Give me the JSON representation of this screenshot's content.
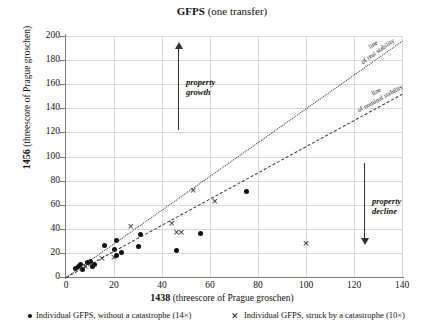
{
  "chart_data": {
    "type": "scatter",
    "title": "GFPS (one transfer)",
    "title_bold_part": "GFPS",
    "title_rest": " (one transfer)",
    "xlabel": "1438 (threescore of Prague groschen)",
    "xlabel_bold": "1438",
    "xlabel_rest": " (threescore of Prague groschen)",
    "ylabel": "1456 (threescore of Prague groschen)",
    "ylabel_bold": "1456",
    "ylabel_rest": " (threescore of Prague groschen)",
    "xlim": [
      0,
      140
    ],
    "ylim": [
      0,
      200
    ],
    "xticks": [
      0,
      20,
      40,
      60,
      80,
      100,
      120,
      140
    ],
    "yticks": [
      0,
      20,
      40,
      60,
      80,
      100,
      120,
      140,
      160,
      180,
      200
    ],
    "grid": true,
    "legend_position": "below-axis",
    "series": [
      {
        "name": "Individual GFPS, without a catastrophe (14×)",
        "marker": "dot",
        "count": 14,
        "points": [
          [
            4,
            7
          ],
          [
            5,
            9
          ],
          [
            6,
            10
          ],
          [
            7,
            6
          ],
          [
            9,
            12
          ],
          [
            10,
            13
          ],
          [
            11,
            9
          ],
          [
            12,
            10
          ],
          [
            16,
            26
          ],
          [
            20,
            23
          ],
          [
            21,
            30
          ],
          [
            23,
            20
          ],
          [
            30,
            25
          ],
          [
            31,
            35
          ]
        ]
      },
      {
        "name": "Individual GFPS, struck by a catastrophe (10×)",
        "marker": "cross",
        "count": 10,
        "points": [
          [
            8,
            9
          ],
          [
            15,
            15
          ],
          [
            20,
            16
          ],
          [
            27,
            42
          ],
          [
            44,
            44
          ],
          [
            46,
            37
          ],
          [
            48,
            37
          ],
          [
            53,
            72
          ],
          [
            62,
            63
          ],
          [
            100,
            28
          ]
        ]
      },
      {
        "name": "extra-dots",
        "marker": "dot",
        "count": 4,
        "points": [
          [
            46,
            22
          ],
          [
            56,
            36
          ],
          [
            75,
            71
          ],
          [
            21,
            18
          ]
        ]
      }
    ],
    "reference_lines": [
      {
        "name": "line of real stability",
        "label_line1": "line",
        "label_line2": "of real stability",
        "style": "dotted",
        "from": [
          0,
          0
        ],
        "to": [
          140,
          196
        ]
      },
      {
        "name": "line of nominal stability",
        "label_line1": "line",
        "label_line2": "of nominal stability",
        "style": "dash-dot",
        "from": [
          0,
          0
        ],
        "to": [
          140,
          152
        ]
      }
    ],
    "annotations": [
      {
        "name": "property-growth",
        "text_line1": "property",
        "text_line2": "growth",
        "arrow": "up",
        "at_x": 40
      },
      {
        "name": "property-decline",
        "text_line1": "property",
        "text_line2": "decline",
        "arrow": "down",
        "at_x": 116
      }
    ]
  },
  "colors": {
    "marker": "#101010",
    "grid": "#d9d9d9",
    "axis": "#7c7c7c",
    "annotation": "#333333"
  }
}
